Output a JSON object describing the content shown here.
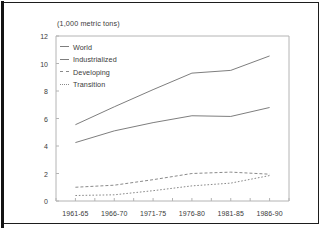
{
  "figure": {
    "title": "(1,000 metric tons)",
    "background": "#ffffff",
    "frame_color": "#1d1d1d"
  },
  "legend": {
    "position": "top-left-inside",
    "entries": [
      {
        "label": "World",
        "style": "solid",
        "color": "#7e7e7e"
      },
      {
        "label": "Industrialized",
        "style": "solid",
        "color": "#7e7e7e"
      },
      {
        "label": "Developing",
        "style": "dashed",
        "color": "#8a8a8a"
      },
      {
        "label": "Transition",
        "style": "dotted",
        "color": "#8a8a8a"
      }
    ]
  },
  "axes": {
    "y_ticks": [
      "12",
      "10",
      "8",
      "6",
      "4",
      "2",
      "0"
    ],
    "x_ticks": [
      "1961-65",
      "1966-70",
      "1971-75",
      "1976-80",
      "1981-85",
      "1986-90"
    ],
    "ylim": [
      0,
      12
    ],
    "grid": false
  },
  "chart_data": {
    "type": "line",
    "title": "(1,000 metric tons)",
    "xlabel": "",
    "ylabel": "(1,000 metric tons)",
    "ylim": [
      0,
      12
    ],
    "categories": [
      "1961-65",
      "1966-70",
      "1971-75",
      "1976-80",
      "1981-85",
      "1986-90"
    ],
    "series": [
      {
        "name": "World",
        "style": "solid",
        "color": "#7e7e7e",
        "values": [
          5.55,
          6.85,
          8.1,
          9.3,
          9.5,
          10.55
        ]
      },
      {
        "name": "Industrialized",
        "style": "solid",
        "color": "#7e7e7e",
        "values": [
          4.25,
          5.1,
          5.7,
          6.2,
          6.15,
          6.8
        ]
      },
      {
        "name": "Developing",
        "style": "dashed",
        "color": "#8a8a8a",
        "values": [
          1.0,
          1.15,
          1.55,
          2.0,
          2.1,
          1.95
        ]
      },
      {
        "name": "Transition",
        "style": "dotted",
        "color": "#8a8a8a",
        "values": [
          0.4,
          0.45,
          0.75,
          1.1,
          1.3,
          1.85
        ]
      }
    ],
    "legend_position": "upper left",
    "grid": false
  }
}
